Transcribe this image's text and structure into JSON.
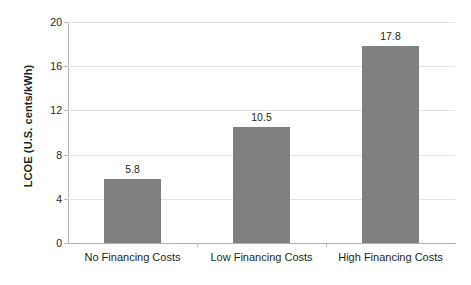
{
  "chart_data": {
    "type": "bar",
    "title": "",
    "xlabel": "",
    "ylabel": "LCOE (U.S. cents/kWh)",
    "categories": [
      "No Financing Costs",
      "Low Financing Costs",
      "High Financing Costs"
    ],
    "values": [
      5.8,
      10.5,
      17.8
    ],
    "value_labels": [
      "5.8",
      "10.5",
      "17.8"
    ],
    "ylim": [
      0,
      20
    ],
    "yticks": [
      0,
      4,
      8,
      12,
      16,
      20
    ],
    "ytick_labels": [
      "0",
      "4",
      "8",
      "12",
      "16",
      "20"
    ],
    "grid": true,
    "legend": "none",
    "colors": {
      "bar": "#808080",
      "gridline": "#e3e3e3",
      "axis": "#b8b8b8",
      "text": "#231f20",
      "background": "#ffffff"
    }
  }
}
